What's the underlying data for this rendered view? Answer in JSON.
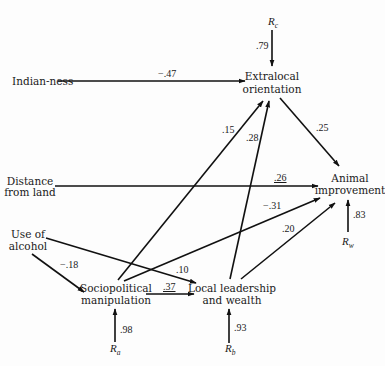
{
  "nodes": {
    "indianness": {
      "label": "Indian-ness"
    },
    "extralocal": {
      "line1": "Extralocal",
      "line2": "orientation"
    },
    "distance": {
      "line1": "Distance",
      "line2": "from land"
    },
    "animal": {
      "line1": "Animal",
      "line2": "improvement"
    },
    "alcohol": {
      "line1": "Use of",
      "line2": "alcohol"
    },
    "sociopolitical": {
      "line1": "Sociopolitical",
      "line2": "manipulation"
    },
    "local": {
      "line1": "Local leadership",
      "line2": "and wealth"
    }
  },
  "residuals": {
    "rc": {
      "base": "R",
      "sub": "c",
      "coef": ".79"
    },
    "rw": {
      "base": "R",
      "sub": "w",
      "coef": ".83"
    },
    "ra": {
      "base": "R",
      "sub": "a",
      "coef": ".98"
    },
    "rb": {
      "base": "R",
      "sub": "b",
      "coef": ".93"
    }
  },
  "paths": {
    "indianness_extralocal": "−.47",
    "sociopolitical_extralocal": ".15",
    "local_extralocal": ".28",
    "extralocal_animal": ".25",
    "distance_animal": ".26",
    "sociopolitical_animal": "−.31",
    "local_animal": ".20",
    "alcohol_sociopolitical": "−.18",
    "alcohol_local": ".10",
    "sociopolitical_local": ".37"
  },
  "colors": {
    "ink": "#111111",
    "background": "#fdfdfd"
  }
}
